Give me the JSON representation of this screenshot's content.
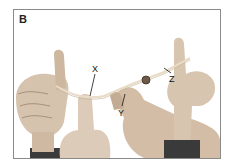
{
  "figure": {
    "panel_letter": "B",
    "labels": {
      "x": "X",
      "y": "Y",
      "z": "Z"
    }
  }
}
